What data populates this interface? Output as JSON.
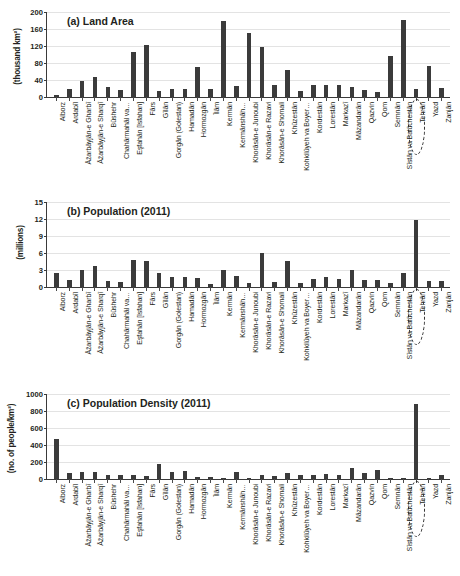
{
  "figure": {
    "categories": [
      "Alborz",
      "Ardabīl",
      "Āz̄arbāyjān-e Gharbī",
      "Āz̄arbāyjān-e Sharqī",
      "Būshehr",
      "Chahārmahāl va…",
      "Eşfahān [Isfahan]",
      "Fārs",
      "Gīlān",
      "Gorgān (Golestan)",
      "Hamadān",
      "Hormozgān",
      "Īlām",
      "Kermān",
      "Kermānshāh…",
      "Khorāsān-e Junoubi",
      "Khorāsān-e Razavi",
      "Khorāsān-e Shomali",
      "Khūzestān",
      "Kohkilūyeh va Boyer…",
      "Kordestān",
      "Lorestān",
      "Markazī",
      "Māzandarān",
      "Qazvin",
      "Qom",
      "Semnān",
      "Sīstān va Balūchestān",
      "Tehrān",
      "Yazd",
      "Zanjān"
    ],
    "highlight_category": "Tehrān"
  },
  "chart_data": [
    {
      "type": "bar",
      "title": "(a) Land Area",
      "ylabel": "(thousand km²)",
      "xlabel": "",
      "ylim": [
        0,
        200
      ],
      "yticks": [
        0,
        40,
        80,
        120,
        160,
        200
      ],
      "grid": true,
      "categories": [
        "Alborz",
        "Ardabīl",
        "Āz̄arbāyjān-e Gharbī",
        "Āz̄arbāyjān-e Sharqī",
        "Būshehr",
        "Chahārmahāl va…",
        "Eşfahān [Isfahan]",
        "Fārs",
        "Gīlān",
        "Gorgān (Golestan)",
        "Hamadān",
        "Hormozgān",
        "Īlām",
        "Kermān",
        "Kermānshāh…",
        "Khorāsān-e Junoubi",
        "Khorāsān-e Razavi",
        "Khorāsān-e Shomali",
        "Khūzestān",
        "Kohkilūyeh va Boyer…",
        "Kordestān",
        "Lorestān",
        "Markazī",
        "Māzandarān",
        "Qazvin",
        "Qom",
        "Semnān",
        "Sīstān va Balūchestān",
        "Tehrān",
        "Yazd",
        "Zanjān"
      ],
      "values": [
        5,
        18,
        38,
        46,
        23,
        17,
        107,
        122,
        14,
        20,
        19,
        70,
        20,
        180,
        25,
        151,
        118,
        28,
        64,
        15,
        29,
        28,
        29,
        24,
        16,
        11,
        97,
        181,
        19,
        74,
        22
      ]
    },
    {
      "type": "bar",
      "title": "(b) Population (2011)",
      "ylabel": "(millions)",
      "xlabel": "",
      "ylim": [
        0,
        15
      ],
      "yticks": [
        0,
        3,
        6,
        9,
        12,
        15
      ],
      "grid": true,
      "categories": [
        "Alborz",
        "Ardabīl",
        "Āz̄arbāyjān-e Gharbī",
        "Āz̄arbāyjān-e Sharqī",
        "Būshehr",
        "Chahārmahāl va…",
        "Eşfahān [Isfahan]",
        "Fārs",
        "Gīlān",
        "Gorgān (Golestan)",
        "Hamadān",
        "Hormozgān",
        "Īlām",
        "Kermān",
        "Kermānshāh…",
        "Khorāsān-e Junoubi",
        "Khorāsān-e Razavi",
        "Khorāsān-e Shomali",
        "Khūzestān",
        "Kohkilūyeh va Boyer…",
        "Kordestān",
        "Lorestān",
        "Markazī",
        "Māzandarān",
        "Qazvin",
        "Qom",
        "Semnān",
        "Sīstān va Balūchestān",
        "Tehrān",
        "Yazd",
        "Zanjān"
      ],
      "values": [
        2.4,
        1.25,
        3.08,
        3.72,
        1.03,
        0.9,
        4.85,
        4.6,
        2.45,
        1.78,
        1.76,
        1.62,
        0.56,
        2.95,
        1.95,
        0.65,
        5.95,
        0.87,
        4.55,
        0.67,
        1.5,
        1.75,
        1.42,
        3.07,
        1.2,
        1.15,
        0.63,
        2.55,
        11.8,
        1.07,
        1.05
      ]
    },
    {
      "type": "bar",
      "title": "(c) Population Density (2011)",
      "ylabel": "(no. of people/km²)",
      "xlabel": "",
      "ylim": [
        0,
        1000
      ],
      "yticks": [
        0,
        200,
        400,
        600,
        800,
        1000
      ],
      "grid": true,
      "categories": [
        "Alborz",
        "Ardabīl",
        "Āz̄arbāyjān-e Gharbī",
        "Āz̄arbāyjān-e Sharqī",
        "Būshehr",
        "Chahārmahāl va…",
        "Eşfahān [Isfahan]",
        "Fārs",
        "Gīlān",
        "Gorgān (Golestan)",
        "Hamadān",
        "Hormozgān",
        "Īlām",
        "Kermān",
        "Kermānshāh…",
        "Khorāsān-e Junoubi",
        "Khorāsān-e Razavi",
        "Khorāsān-e Shomali",
        "Khūzestān",
        "Kohkilūyeh va Boyer…",
        "Kordestān",
        "Lorestān",
        "Markazī",
        "Māzandarān",
        "Qazvin",
        "Qom",
        "Semnān",
        "Sīstān va Balūchestān",
        "Tehrān",
        "Yazd",
        "Zanjān"
      ],
      "values": [
        470,
        68,
        81,
        80,
        45,
        52,
        45,
        38,
        174,
        88,
        93,
        23,
        28,
        16,
        78,
        4,
        50,
        31,
        71,
        45,
        52,
        63,
        49,
        128,
        75,
        105,
        6,
        14,
        880,
        14,
        48
      ]
    }
  ]
}
